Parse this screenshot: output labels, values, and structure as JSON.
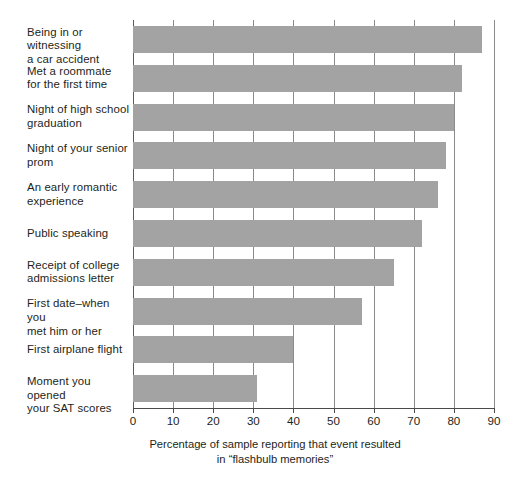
{
  "chart_data": {
    "type": "bar",
    "orientation": "horizontal",
    "title": "",
    "subtitle": "",
    "xlabel": "Percentage of sample reporting that event resulted\nin “flashbulb memories”",
    "xlabel_line1": "Percentage of sample reporting that event resulted",
    "xlabel_line2": "in “flashbulb memories”",
    "ylabel": "",
    "categories": [
      "Being in or witnessing\na car accident",
      "Met a roommate\nfor the first time",
      "Night of high school\ngraduation",
      "Night of your senior\nprom",
      "An early romantic\nexperience",
      "Public speaking",
      "Receipt of college\nadmissions letter",
      "First date–when you\nmet him or her",
      "First airplane flight",
      "Moment you opened\nyour SAT scores"
    ],
    "values": [
      87,
      82,
      80,
      78,
      76,
      72,
      65,
      57,
      40,
      31
    ],
    "xlim": [
      0,
      90
    ],
    "xticks": [
      0,
      10,
      20,
      30,
      40,
      50,
      60,
      70,
      80,
      90
    ],
    "xtick_labels": [
      "0",
      "10",
      "20",
      "30",
      "40",
      "50",
      "60",
      "70",
      "80",
      "90"
    ],
    "grid": true,
    "grid_axis": "x",
    "legend": false,
    "bar_color": "#a3a3a3",
    "grid_color": "#8b8b8b",
    "axis_color": "#4a4a4a",
    "text_color": "#231f20",
    "background": "#ffffff"
  }
}
